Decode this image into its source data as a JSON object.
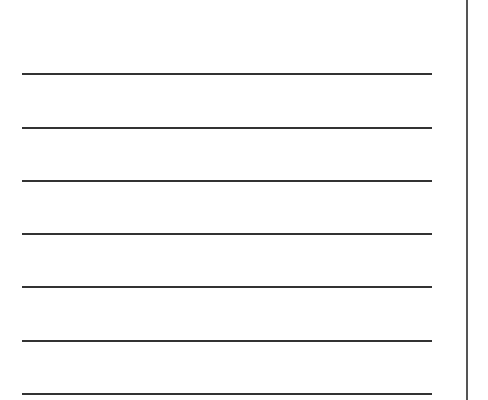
{
  "sheet": {
    "background": "#ffffff",
    "line_color": "#333333",
    "margin_line_color": "#555555",
    "ruled_lines": [
      {
        "y": 73
      },
      {
        "y": 127
      },
      {
        "y": 180
      },
      {
        "y": 233
      },
      {
        "y": 286
      },
      {
        "y": 340
      },
      {
        "y": 393
      }
    ],
    "line_count": 7
  }
}
